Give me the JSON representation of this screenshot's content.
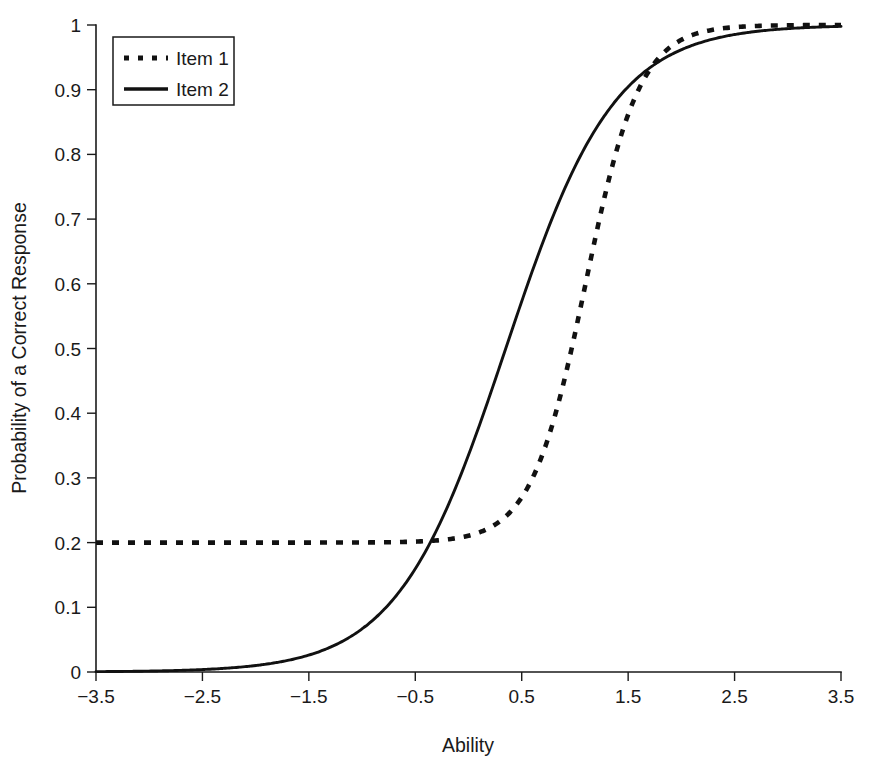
{
  "chart_data": {
    "type": "line",
    "title": "",
    "subtitle": "",
    "xlabel": "Ability",
    "ylabel": "Probability of a Correct Response",
    "xlim": [
      -3.5,
      3.5
    ],
    "ylim": [
      0,
      1
    ],
    "grid": false,
    "legend_position": "top-left",
    "xticks": [
      -3.5,
      -2.5,
      -1.5,
      -0.5,
      0.5,
      1.5,
      2.5,
      3.5
    ],
    "xtick_labels": [
      "−3.5",
      "−2.5",
      "−1.5",
      "−0.5",
      "0.5",
      "1.5",
      "2.5",
      "3.5"
    ],
    "yticks": [
      0,
      0.1,
      0.2,
      0.3,
      0.4,
      0.5,
      0.6,
      0.7,
      0.8,
      0.9,
      1
    ],
    "ytick_labels": [
      "0",
      "0.1",
      "0.2",
      "0.3",
      "0.4",
      "0.5",
      "0.6",
      "0.7",
      "0.8",
      "0.9",
      "1"
    ],
    "x": [
      -3.5,
      -3.25,
      -3.0,
      -2.75,
      -2.5,
      -2.25,
      -2.0,
      -1.75,
      -1.5,
      -1.25,
      -1.0,
      -0.75,
      -0.5,
      -0.25,
      0.0,
      0.25,
      0.5,
      0.75,
      1.0,
      1.25,
      1.5,
      1.75,
      2.0,
      2.25,
      2.5,
      2.75,
      3.0,
      3.25,
      3.5
    ],
    "series": [
      {
        "name": "Item 1",
        "style": "dashed",
        "color": "#111111",
        "model": "3PL",
        "a": 2.3,
        "b": 1.1,
        "c": 0.2,
        "values": [
          0.2,
          0.2,
          0.2,
          0.2,
          0.2,
          0.201,
          0.201,
          0.202,
          0.203,
          0.205,
          0.208,
          0.213,
          0.221,
          0.234,
          0.254,
          0.283,
          0.327,
          0.391,
          0.477,
          0.582,
          0.692,
          0.789,
          0.862,
          0.912,
          0.944,
          0.965,
          0.978,
          0.986,
          0.991
        ]
      },
      {
        "name": "Item 2",
        "style": "solid",
        "color": "#111111",
        "model": "2PL",
        "a": 1.15,
        "b": 0.35,
        "c": 0.0,
        "values": [
          0.017,
          0.023,
          0.03,
          0.039,
          0.051,
          0.067,
          0.087,
          0.112,
          0.143,
          0.181,
          0.228,
          0.282,
          0.344,
          0.412,
          0.485,
          0.557,
          0.627,
          0.691,
          0.748,
          0.797,
          0.838,
          0.871,
          0.898,
          0.92,
          0.937,
          0.951,
          0.962,
          0.97,
          0.977
        ]
      }
    ],
    "annotations": [
      {
        "label": "Item 1 lower asymptote",
        "value": 0.2
      },
      {
        "label": "crossing-lower",
        "x": -0.88,
        "y": 0.207
      },
      {
        "label": "crossing-upper",
        "x": 0.95,
        "y": 0.635
      }
    ]
  },
  "legend": {
    "items": [
      {
        "label": "Item 1",
        "style": "dashed"
      },
      {
        "label": "Item 2",
        "style": "solid"
      }
    ]
  },
  "axes": {
    "x_title": "Ability",
    "y_title": "Probability of a Correct Response"
  }
}
